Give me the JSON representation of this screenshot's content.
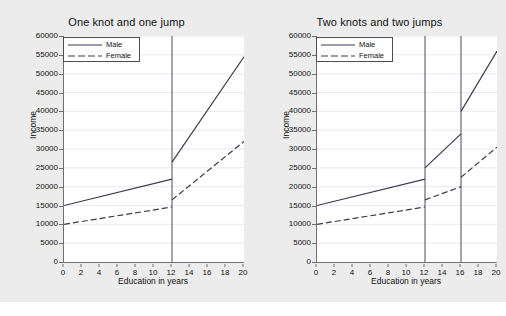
{
  "figure": {
    "background_color": "#ececec",
    "plot_background_color": "#ffffff",
    "axis_color": "#6f6f6f",
    "series_color": "#3a3a4f"
  },
  "chart_data": [
    {
      "type": "line",
      "title": "One knot and one jump",
      "xlabel": "Education in years",
      "ylabel": "Income",
      "xlim": [
        0,
        20
      ],
      "ylim": [
        0,
        60000
      ],
      "xticks": [
        0,
        2,
        4,
        6,
        8,
        10,
        12,
        14,
        16,
        18,
        20
      ],
      "yticks": [
        0,
        5000,
        10000,
        15000,
        20000,
        25000,
        30000,
        35000,
        40000,
        45000,
        50000,
        55000,
        60000
      ],
      "grid": "horizontal",
      "legend_position": "top-left",
      "knots": [
        12
      ],
      "series": [
        {
          "name": "Male",
          "style": "solid",
          "segments": [
            {
              "x": [
                0,
                12
              ],
              "y": [
                15000,
                22000
              ]
            },
            {
              "x": [
                12,
                20
              ],
              "y": [
                26500,
                54500
              ]
            }
          ]
        },
        {
          "name": "Female",
          "style": "dashed",
          "segments": [
            {
              "x": [
                0,
                12
              ],
              "y": [
                10000,
                14600
              ]
            },
            {
              "x": [
                12,
                20
              ],
              "y": [
                16500,
                32000
              ]
            }
          ]
        }
      ]
    },
    {
      "type": "line",
      "title": "Two knots and two jumps",
      "xlabel": "Education in years",
      "ylabel": "Income",
      "xlim": [
        0,
        20
      ],
      "ylim": [
        0,
        60000
      ],
      "xticks": [
        0,
        2,
        4,
        6,
        8,
        10,
        12,
        14,
        16,
        18,
        20
      ],
      "yticks": [
        0,
        5000,
        10000,
        15000,
        20000,
        25000,
        30000,
        35000,
        40000,
        45000,
        50000,
        55000,
        60000
      ],
      "grid": "horizontal",
      "legend_position": "top-left",
      "knots": [
        12,
        16
      ],
      "series": [
        {
          "name": "Male",
          "style": "solid",
          "segments": [
            {
              "x": [
                0,
                12
              ],
              "y": [
                15000,
                22000
              ]
            },
            {
              "x": [
                12,
                16
              ],
              "y": [
                25000,
                34000
              ]
            },
            {
              "x": [
                16,
                20
              ],
              "y": [
                40000,
                56000
              ]
            }
          ]
        },
        {
          "name": "Female",
          "style": "dashed",
          "segments": [
            {
              "x": [
                0,
                12
              ],
              "y": [
                10000,
                14600
              ]
            },
            {
              "x": [
                12,
                16
              ],
              "y": [
                16500,
                20000
              ]
            },
            {
              "x": [
                16,
                20
              ],
              "y": [
                22500,
                30500
              ]
            }
          ]
        }
      ]
    }
  ],
  "panels": [
    {
      "title": "One knot and one jump",
      "xlabel": "Education in years",
      "ylabel": "Income",
      "legend": [
        {
          "label": "Male",
          "style": "solid"
        },
        {
          "label": "Female",
          "style": "dashed"
        }
      ],
      "ytick_labels": [
        "60000",
        "55000",
        "50000",
        "45000",
        "40000",
        "35000",
        "30000",
        "25000",
        "20000",
        "15000",
        "10000",
        "5000",
        "0"
      ],
      "xtick_labels": [
        "0",
        "2",
        "4",
        "6",
        "8",
        "10",
        "12",
        "14",
        "16",
        "18",
        "20"
      ]
    },
    {
      "title": "Two knots and two jumps",
      "xlabel": "Education in years",
      "ylabel": "Income",
      "legend": [
        {
          "label": "Male",
          "style": "solid"
        },
        {
          "label": "Female",
          "style": "dashed"
        }
      ],
      "ytick_labels": [
        "60000",
        "55000",
        "50000",
        "45000",
        "40000",
        "35000",
        "30000",
        "25000",
        "20000",
        "15000",
        "10000",
        "5000",
        "0"
      ],
      "xtick_labels": [
        "0",
        "2",
        "4",
        "6",
        "8",
        "10",
        "12",
        "14",
        "16",
        "18",
        "20"
      ]
    }
  ]
}
